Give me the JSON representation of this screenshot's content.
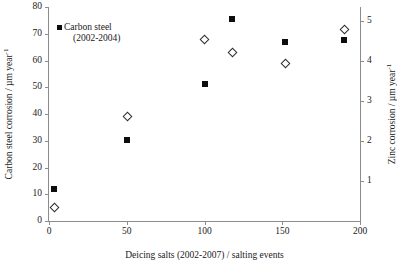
{
  "chart_data": {
    "type": "scatter",
    "title": "",
    "xlabel": "Deicing salts (2002-2007) / salting events",
    "ylabel": "Carbon steel corrosion / µm year",
    "ylabel_exponent": "-1",
    "y2label": "Zinc corrosion / µm year",
    "y2label_exponent": "-1",
    "xlim": [
      0,
      200
    ],
    "ylim": [
      0,
      80
    ],
    "y2lim": [
      0,
      5.35
    ],
    "grid": false,
    "legend_position": "top-left",
    "xticks": [
      0,
      50,
      100,
      150,
      200
    ],
    "xticklabels": [
      "0",
      "50",
      "100",
      "150",
      "200"
    ],
    "yticks": [
      0,
      10,
      20,
      30,
      40,
      50,
      60,
      70,
      80
    ],
    "yticklabels": [
      "0",
      "10",
      "20",
      "30",
      "40",
      "50",
      "60",
      "70",
      "80"
    ],
    "y2ticks": [
      1,
      2,
      3,
      4,
      5
    ],
    "y2ticklabels": [
      "1",
      "2",
      "3",
      "4",
      "5"
    ],
    "series": [
      {
        "name": "Carbon steel (2002-2004)",
        "marker": "filled-square",
        "axis": "left",
        "legend_label_line1": "Carbon steel",
        "legend_label_line2": "(2002-2004)",
        "points": [
          {
            "x": 3,
            "y": 12.0
          },
          {
            "x": 50,
            "y": 30.2
          },
          {
            "x": 100,
            "y": 51.3
          },
          {
            "x": 118,
            "y": 75.5
          },
          {
            "x": 152,
            "y": 67.0
          },
          {
            "x": 190,
            "y": 67.5
          }
        ]
      },
      {
        "name": "Zinc",
        "marker": "open-diamond",
        "axis": "right",
        "points": [
          {
            "x": 3,
            "y": 0.35
          },
          {
            "x": 50,
            "y": 2.62
          },
          {
            "x": 100,
            "y": 4.55
          },
          {
            "x": 118,
            "y": 4.22
          },
          {
            "x": 152,
            "y": 3.96
          },
          {
            "x": 190,
            "y": 4.8
          }
        ]
      }
    ]
  },
  "colors": {
    "marker_fill": "#0d0d0d",
    "marker_outline": "#2b2b2b",
    "axis": "#8c8c8c",
    "text": "#1a1a1a",
    "background": "#ffffff"
  }
}
